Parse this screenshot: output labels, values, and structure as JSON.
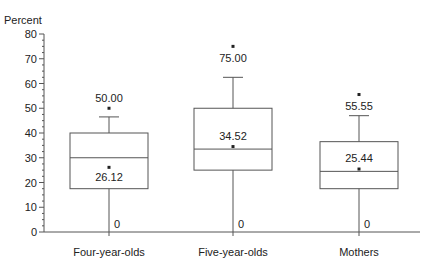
{
  "chart_data": {
    "type": "boxplot",
    "title": "",
    "ylabel": "Percent",
    "xlabel": "",
    "ylim": [
      0,
      80
    ],
    "yticks": [
      0,
      10,
      20,
      30,
      40,
      50,
      60,
      70,
      80
    ],
    "grid": false,
    "legend": null,
    "categories": [
      "Four-year-olds",
      "Five-year-olds",
      "Mothers"
    ],
    "series": [
      {
        "name": "Four-year-olds",
        "min": 0,
        "q1": 17.5,
        "median": 30,
        "q3": 40,
        "whisker_high": 46.5,
        "max": 50.0,
        "mean": 26.12,
        "labels": {
          "max": "50.00",
          "mean": "26.12",
          "min": "0"
        }
      },
      {
        "name": "Five-year-olds",
        "min": 0,
        "q1": 25,
        "median": 33.5,
        "q3": 50,
        "whisker_high": 62.5,
        "max": 75.0,
        "mean": 34.52,
        "labels": {
          "max": "75.00",
          "mean": "34.52",
          "min": "0"
        }
      },
      {
        "name": "Mothers",
        "min": 0,
        "q1": 17.5,
        "median": 24.5,
        "q3": 36.5,
        "whisker_high": 47,
        "max": 55.55,
        "mean": 25.44,
        "labels": {
          "max": "55.55",
          "mean": "25.44",
          "min": "0"
        }
      }
    ]
  },
  "layout": {
    "axis_color": "#555555",
    "box_color": "#555555",
    "text_color": "#222222"
  }
}
